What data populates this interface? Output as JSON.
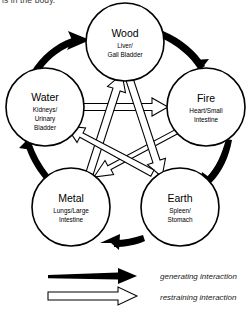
{
  "page": {
    "top_cut_text": "is in the body.",
    "background_color": "#ffffff",
    "ink_color": "#000000"
  },
  "diagram": {
    "type": "five-element-cycle",
    "nodes": [
      {
        "id": "wood",
        "element": "Wood",
        "organs_line1": "Liver/",
        "organs_line2": "Gall Bladder",
        "organs_line3": "",
        "cx": 125,
        "cy": 42,
        "r": 39
      },
      {
        "id": "fire",
        "element": "Fire",
        "organs_line1": "Heart/Small",
        "organs_line2": "Intestine",
        "organs_line3": "",
        "cx": 206,
        "cy": 107,
        "r": 39
      },
      {
        "id": "earth",
        "element": "Earth",
        "organs_line1": "Spleen/",
        "organs_line2": "Stomach",
        "organs_line3": "",
        "cx": 180,
        "cy": 207,
        "r": 39
      },
      {
        "id": "metal",
        "element": "Metal",
        "organs_line1": "Lungs/Large",
        "organs_line2": "Intestine",
        "organs_line3": "",
        "cx": 71,
        "cy": 207,
        "r": 39
      },
      {
        "id": "water",
        "element": "Water",
        "organs_line1": "Kidneys/",
        "organs_line2": "Urinary",
        "organs_line3": "Bladder",
        "cx": 45,
        "cy": 107,
        "r": 39
      }
    ],
    "generating_edges": [
      {
        "from": "wood",
        "to": "fire"
      },
      {
        "from": "fire",
        "to": "earth"
      },
      {
        "from": "earth",
        "to": "metal"
      },
      {
        "from": "metal",
        "to": "water"
      },
      {
        "from": "water",
        "to": "wood"
      }
    ],
    "restraining_edges": [
      {
        "from": "water",
        "to": "fire"
      },
      {
        "from": "fire",
        "to": "metal"
      },
      {
        "from": "metal",
        "to": "wood"
      },
      {
        "from": "wood",
        "to": "earth"
      },
      {
        "from": "earth",
        "to": "water"
      }
    ]
  },
  "legend": {
    "generating_label": "generating interaction",
    "restraining_label": "restraining interaction"
  }
}
